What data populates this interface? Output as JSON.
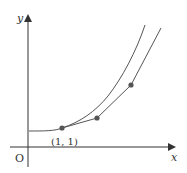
{
  "diagram": {
    "type": "function-graph",
    "labels": {
      "y_axis": "y",
      "x_axis": "x",
      "origin": "O",
      "point": "(1, 1)"
    },
    "colors": {
      "stroke": "#555555",
      "axis": "#333333",
      "point": "#555555",
      "text": "#333333",
      "background": "#ffffff"
    },
    "curve_path": "M29,131 C45,131 55,131 62,128 C80,122 95,112 108,96 C122,78 136,52 145,25",
    "polyline_points": "62,128 97,118 131,85 161,28",
    "marked_points": [
      {
        "x": 62,
        "y": 128,
        "label": "(1, 1)"
      },
      {
        "x": 97,
        "y": 118
      },
      {
        "x": 131,
        "y": 85
      }
    ]
  }
}
